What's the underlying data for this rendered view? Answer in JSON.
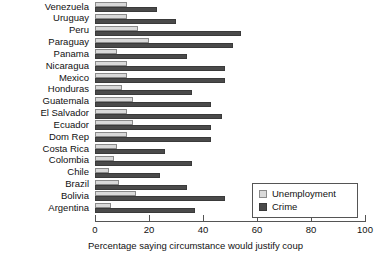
{
  "chart_data": {
    "type": "bar",
    "orientation": "horizontal",
    "title": "",
    "xlabel": "Percentage saying circumstance would justify coup",
    "ylabel": "",
    "xlim": [
      0,
      100
    ],
    "xticks": [
      0,
      20,
      40,
      60,
      80,
      100
    ],
    "xtick_labels": [
      "0",
      "20",
      "40",
      "60",
      "80",
      "100"
    ],
    "grid": false,
    "legend_position": "lower-right",
    "categories": [
      "Venezuela",
      "Uruguay",
      "Peru",
      "Paraguay",
      "Panama",
      "Nicaragua",
      "Mexico",
      "Honduras",
      "Guatemala",
      "El Salvador",
      "Ecuador",
      "Dom Rep",
      "Costa Rica",
      "Colombia",
      "Chile",
      "Brazil",
      "Bolivia",
      "Argentina"
    ],
    "series": [
      {
        "name": "Unemployment",
        "color": "#d9d9d9",
        "values": [
          12,
          12,
          16,
          20,
          8,
          12,
          12,
          10,
          14,
          12,
          14,
          12,
          8,
          7,
          5,
          9,
          15,
          6
        ]
      },
      {
        "name": "Crime",
        "color": "#4a4a4a",
        "values": [
          23,
          30,
          54,
          51,
          34,
          48,
          48,
          36,
          43,
          47,
          43,
          43,
          26,
          36,
          24,
          34,
          48,
          37
        ]
      }
    ]
  },
  "legend": {
    "entries": [
      {
        "label": "Unemployment"
      },
      {
        "label": "Crime"
      }
    ]
  }
}
